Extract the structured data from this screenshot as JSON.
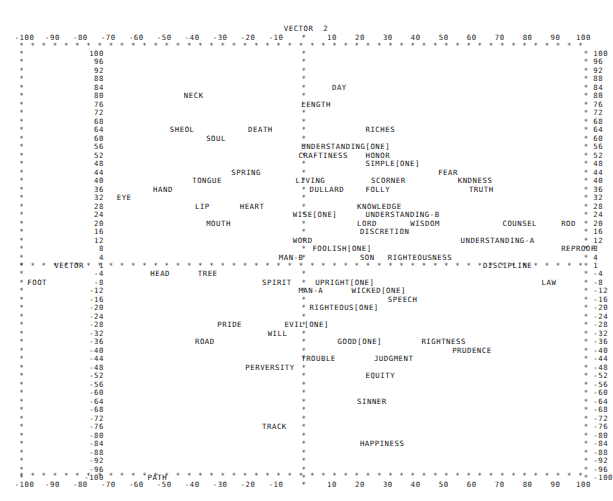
{
  "plot": {
    "type": "character-scatter-plot",
    "title_top": "VECTOR  2",
    "title_left": "VECTOR",
    "left_axis_zero_label": "1",
    "axis_marker_char": "*",
    "background_color": "#ffffff",
    "text_color": "#16161a"
  },
  "chart_data": {
    "type": "scatter",
    "title": "VECTOR  2",
    "xlabel": "VECTOR  2",
    "ylabel": "VECTOR  1",
    "xlim": [
      -100,
      100
    ],
    "ylim": [
      -100,
      100
    ],
    "grid": false,
    "legend": "none",
    "x_ticks": [
      -100,
      -90,
      -80,
      -70,
      -60,
      -50,
      -40,
      -30,
      -20,
      -10,
      0,
      10,
      20,
      30,
      40,
      50,
      60,
      70,
      80,
      90,
      100
    ],
    "x_tick_labels": [
      "-100",
      "-90",
      "-80",
      "-70",
      "-60",
      "-50",
      "-40",
      "-30",
      "-20",
      "-10",
      "*",
      "10",
      "20",
      "30",
      "40",
      "50",
      "60",
      "70",
      "80",
      "90",
      "100"
    ],
    "y_ticks": [
      100,
      96,
      92,
      88,
      84,
      80,
      76,
      72,
      68,
      64,
      60,
      56,
      52,
      48,
      44,
      40,
      36,
      32,
      28,
      24,
      20,
      16,
      12,
      8,
      4,
      1,
      -4,
      -8,
      -12,
      -16,
      -20,
      -24,
      -28,
      -32,
      -36,
      -40,
      -44,
      -48,
      -52,
      -56,
      -60,
      -64,
      -68,
      -72,
      -76,
      -80,
      -84,
      -88,
      -92,
      -96,
      -100
    ],
    "y_tick_labels": [
      "100",
      "96",
      "92",
      "88",
      "84",
      "80",
      "76",
      "72",
      "68",
      "64",
      "60",
      "56",
      "52",
      "48",
      "44",
      "40",
      "36",
      "32",
      "28",
      "24",
      "20",
      "16",
      "12",
      "8",
      "4",
      "1",
      "-4",
      "-8",
      "-12",
      "-16",
      "-20",
      "-24",
      "-28",
      "-32",
      "-36",
      "-40",
      "-44",
      "-48",
      "-52",
      "-56",
      "-60",
      "-64",
      "-68",
      "-72",
      "-76",
      "-80",
      "-84",
      "-88",
      "-92",
      "-96",
      "-100"
    ],
    "points": [
      {
        "label": "NECK",
        "x": -43,
        "y": 80
      },
      {
        "label": "DAY",
        "x": 10,
        "y": 84
      },
      {
        "label": "LENGTH",
        "x": -1,
        "y": 76
      },
      {
        "label": "SHEOL",
        "x": -48,
        "y": 64
      },
      {
        "label": "SOUL",
        "x": -35,
        "y": 60
      },
      {
        "label": "DEATH",
        "x": -20,
        "y": 64
      },
      {
        "label": "RICHES",
        "x": 22,
        "y": 64
      },
      {
        "label": "UNDERSTANDING[ONE]",
        "x": -1,
        "y": 56
      },
      {
        "label": "CRAFTINESS",
        "x": -2,
        "y": 52
      },
      {
        "label": "HONOR",
        "x": 22,
        "y": 52
      },
      {
        "label": "SIMPLE[ONE]",
        "x": 22,
        "y": 48
      },
      {
        "label": "SPRING",
        "x": -26,
        "y": 44
      },
      {
        "label": "FEAR",
        "x": 48,
        "y": 44
      },
      {
        "label": "TONGUE",
        "x": -40,
        "y": 40
      },
      {
        "label": "LIVING",
        "x": -3,
        "y": 40
      },
      {
        "label": "SCORNER",
        "x": 24,
        "y": 40
      },
      {
        "label": "KNDNESS",
        "x": 55,
        "y": 40
      },
      {
        "label": "HAND",
        "x": -54,
        "y": 36
      },
      {
        "label": "DULLARD",
        "x": 2,
        "y": 36
      },
      {
        "label": "FOLLY",
        "x": 22,
        "y": 36
      },
      {
        "label": "TRUTH",
        "x": 59,
        "y": 36
      },
      {
        "label": "EYE",
        "x": -67,
        "y": 32
      },
      {
        "label": "LIP",
        "x": -39,
        "y": 28
      },
      {
        "label": "HEART",
        "x": -23,
        "y": 28
      },
      {
        "label": "KNOWLEDGE",
        "x": 19,
        "y": 28
      },
      {
        "label": "WISE[ONE]",
        "x": -4,
        "y": 24
      },
      {
        "label": "UNDERSTANDING-B",
        "x": 22,
        "y": 24
      },
      {
        "label": "MOUTH",
        "x": -35,
        "y": 20
      },
      {
        "label": "LORD",
        "x": 19,
        "y": 20
      },
      {
        "label": "WISDOM",
        "x": 38,
        "y": 20
      },
      {
        "label": "COUNSEL",
        "x": 71,
        "y": 20
      },
      {
        "label": "ROD",
        "x": 92,
        "y": 20
      },
      {
        "label": "DISCRETION",
        "x": 20,
        "y": 16
      },
      {
        "label": "WORD",
        "x": -4,
        "y": 12
      },
      {
        "label": "UNDERSTANDING-A",
        "x": 56,
        "y": 12
      },
      {
        "label": "FOOLISH[ONE]",
        "x": 3,
        "y": 8
      },
      {
        "label": "REPROOF",
        "x": 92,
        "y": 8
      },
      {
        "label": "MAN-B",
        "x": -9,
        "y": 4
      },
      {
        "label": "SON",
        "x": 20,
        "y": 4
      },
      {
        "label": "RIGHTEOUSNESS",
        "x": 30,
        "y": 4
      },
      {
        "label": "DISCIPLINE",
        "x": 64,
        "y": 1
      },
      {
        "label": "HEAD",
        "x": -55,
        "y": -4
      },
      {
        "label": "TREE",
        "x": -38,
        "y": -4
      },
      {
        "label": "FOOT",
        "x": -99,
        "y": -8
      },
      {
        "label": "SPIRIT",
        "x": -15,
        "y": -8
      },
      {
        "label": "UPRIGHT[ONE]",
        "x": 4,
        "y": -8
      },
      {
        "label": "LAW",
        "x": 85,
        "y": -8
      },
      {
        "label": "MAN-A",
        "x": -2,
        "y": -12
      },
      {
        "label": "WICKED[ONE]",
        "x": 17,
        "y": -12
      },
      {
        "label": "SPEECH",
        "x": 30,
        "y": -16
      },
      {
        "label": "RIGHTEOUS[ONE]",
        "x": 2,
        "y": -20
      },
      {
        "label": "PRIDE",
        "x": -31,
        "y": -28
      },
      {
        "label": "EVIL[ONE]",
        "x": -7,
        "y": -28
      },
      {
        "label": "WILL",
        "x": -13,
        "y": -32
      },
      {
        "label": "ROAD",
        "x": -39,
        "y": -36
      },
      {
        "label": "GOOD[ONE]",
        "x": 12,
        "y": -36
      },
      {
        "label": "RIGHTNESS",
        "x": 42,
        "y": -36
      },
      {
        "label": "PRUDENCE",
        "x": 53,
        "y": -40
      },
      {
        "label": "TROUBLE",
        "x": -1,
        "y": -44
      },
      {
        "label": "JUDGMENT",
        "x": 25,
        "y": -44
      },
      {
        "label": "PERVERSITY",
        "x": -21,
        "y": -48
      },
      {
        "label": "EQUITY",
        "x": 22,
        "y": -52
      },
      {
        "label": "SINNER",
        "x": 19,
        "y": -64
      },
      {
        "label": "TRACK",
        "x": -15,
        "y": -76
      },
      {
        "label": "HAPPINESS",
        "x": 20,
        "y": -84
      },
      {
        "label": "PATH",
        "x": -56,
        "y": -100
      }
    ]
  }
}
